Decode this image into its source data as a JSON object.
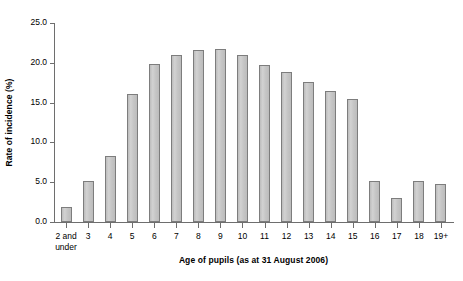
{
  "chart_data": {
    "type": "bar",
    "title": "",
    "xlabel": "Age of pupils (as at 31 August 2006)",
    "ylabel": "Rate of incidence (%)",
    "ylim": [
      0,
      25
    ],
    "ytick_labels": [
      "0.0",
      "5.0",
      "10.0",
      "15.0",
      "20.0",
      "25.0"
    ],
    "ytick_values": [
      0,
      5,
      10,
      15,
      20,
      25
    ],
    "grid": false,
    "legend": false,
    "categories": [
      "2 and\nunder",
      "3",
      "4",
      "5",
      "6",
      "7",
      "8",
      "9",
      "10",
      "11",
      "12",
      "13",
      "14",
      "15",
      "16",
      "17",
      "18",
      "19+"
    ],
    "values": [
      1.9,
      5.2,
      8.3,
      16.1,
      19.8,
      21.0,
      21.6,
      21.7,
      21.0,
      19.7,
      18.8,
      17.6,
      16.5,
      15.5,
      5.1,
      3.0,
      5.1,
      4.8
    ],
    "bar_fill_color": "#c9c9c9",
    "bar_border_color": "#7d7d7d",
    "axis_color": "#6e6e6e"
  }
}
